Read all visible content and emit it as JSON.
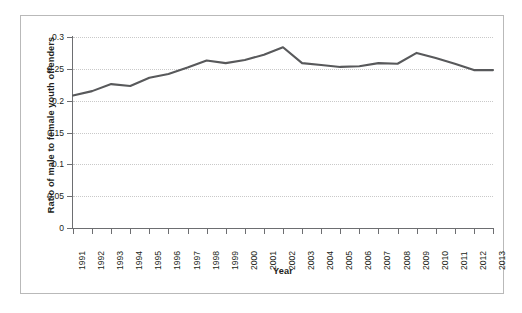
{
  "chart_data": {
    "type": "line",
    "title": "",
    "xlabel": "Year",
    "ylabel": "Ratio of male to female youth offenders",
    "categories": [
      "1991",
      "1992",
      "1993",
      "1994",
      "1995",
      "1996",
      "1997",
      "1998",
      "1999",
      "2000",
      "2001",
      "2002",
      "2003",
      "2004",
      "2005",
      "2006",
      "2007",
      "2008",
      "2009",
      "2010",
      "2011",
      "2012",
      "2013"
    ],
    "values": [
      0.208,
      0.215,
      0.226,
      0.223,
      0.236,
      0.242,
      0.252,
      0.263,
      0.259,
      0.264,
      0.272,
      0.284,
      0.259,
      0.256,
      0.253,
      0.254,
      0.259,
      0.258,
      0.275,
      0.267,
      0.258,
      0.248,
      0.248
    ],
    "ylim": [
      0,
      0.3
    ],
    "yticks": [
      "0",
      "0.05",
      "0.1",
      "0.15",
      "0.2",
      "0.25",
      "0.3"
    ],
    "ytick_values": [
      0,
      0.05,
      0.1,
      0.15,
      0.2,
      0.25,
      0.3
    ],
    "grid": true,
    "legend": false,
    "line_color": "#58595b",
    "grid_color": "#c9c9c9",
    "axis_color": "#6d6e71",
    "frame_color": "#b9b9b9",
    "text_color": "#231f20"
  }
}
